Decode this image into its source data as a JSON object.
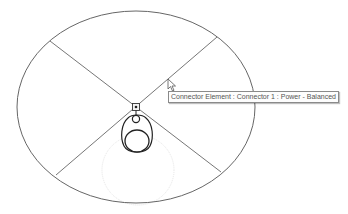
{
  "canvas": {
    "background": "#ffffff",
    "line_color": "#555555",
    "fixture_color": "#333333"
  },
  "tooltip": {
    "text": "Connector Element : Connector 1 : Power - Balanced"
  },
  "cursor": {
    "icon": "arrow-pointer-icon"
  },
  "elements": {
    "ellipse": "light-fixture-outline",
    "connector": "power-connector-icon",
    "fixture": "pendant-fixture-symbol"
  }
}
